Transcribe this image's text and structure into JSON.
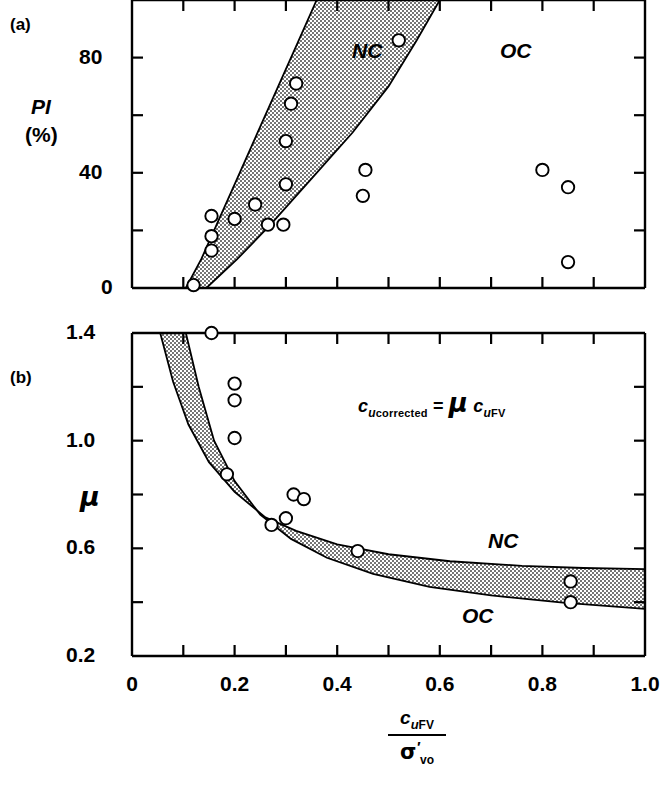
{
  "figure": {
    "panel_a_tag": "(a)",
    "panel_b_tag": "(b)",
    "equation": {
      "c1": "c",
      "sub1_i": "u",
      "sub1": "corrected",
      "equals": "=",
      "mu": "μ",
      "c2": "c",
      "sub2_i": "u",
      "sub2": "FV"
    },
    "xaxis_title": {
      "numer_c": "c",
      "numer_sub_i": "u",
      "numer_sub": "FV",
      "denom_sigma": "σ",
      "denom_prime": "′",
      "denom_sub": "vo"
    }
  },
  "chart_data": [
    {
      "type": "scatter",
      "panel": "(a)",
      "title": "",
      "xlabel": "c_u FV / sigma'_vo",
      "ylabel": "PI (%)",
      "ylabel_lines": [
        "PI",
        "(%)"
      ],
      "xlim": [
        0,
        1.0
      ],
      "ylim": [
        0,
        100
      ],
      "xticks": [
        0,
        0.1,
        0.2,
        0.3,
        0.4,
        0.5,
        0.6,
        0.7,
        0.8,
        0.9,
        1.0
      ],
      "yticks": [
        0,
        20,
        40,
        60,
        80,
        100
      ],
      "ytick_labels": [
        {
          "value": 0,
          "label": "0"
        },
        {
          "value": 40,
          "label": "40"
        },
        {
          "value": 80,
          "label": "80"
        }
      ],
      "grid": false,
      "annotations": [
        {
          "text": "NC",
          "x": 0.45,
          "y": 82
        },
        {
          "text": "OC",
          "x": 0.73,
          "y": 82
        }
      ],
      "bands": [
        {
          "name": "NC-OC transition band",
          "shaded": true,
          "left_boundary": [
            [
              0.105,
              0
            ],
            [
              0.135,
              10
            ],
            [
              0.165,
              22
            ],
            [
              0.205,
              38
            ],
            [
              0.245,
              54
            ],
            [
              0.285,
              70
            ],
            [
              0.325,
              86
            ],
            [
              0.36,
              100
            ]
          ],
          "right_boundary": [
            [
              0.145,
              0
            ],
            [
              0.205,
              10
            ],
            [
              0.27,
              22
            ],
            [
              0.35,
              38
            ],
            [
              0.43,
              54
            ],
            [
              0.5,
              70
            ],
            [
              0.555,
              86
            ],
            [
              0.6,
              100
            ]
          ]
        }
      ],
      "points": [
        {
          "x": 0.12,
          "y": 1
        },
        {
          "x": 0.155,
          "y": 25
        },
        {
          "x": 0.155,
          "y": 18
        },
        {
          "x": 0.155,
          "y": 13
        },
        {
          "x": 0.2,
          "y": 24
        },
        {
          "x": 0.24,
          "y": 29
        },
        {
          "x": 0.265,
          "y": 22
        },
        {
          "x": 0.295,
          "y": 22
        },
        {
          "x": 0.3,
          "y": 36
        },
        {
          "x": 0.3,
          "y": 51
        },
        {
          "x": 0.31,
          "y": 64
        },
        {
          "x": 0.32,
          "y": 71
        },
        {
          "x": 0.455,
          "y": 41
        },
        {
          "x": 0.45,
          "y": 32
        },
        {
          "x": 0.52,
          "y": 86
        },
        {
          "x": 0.8,
          "y": 41
        },
        {
          "x": 0.85,
          "y": 35
        },
        {
          "x": 0.85,
          "y": 9
        }
      ]
    },
    {
      "type": "scatter",
      "panel": "(b)",
      "title": "",
      "xlabel": "c_u FV / sigma'_vo",
      "ylabel": "μ",
      "xlim": [
        0,
        1.0
      ],
      "ylim": [
        0.2,
        1.4
      ],
      "xticks": [
        0,
        0.1,
        0.2,
        0.3,
        0.4,
        0.5,
        0.6,
        0.7,
        0.8,
        0.9,
        1.0
      ],
      "xtick_labels": [
        {
          "value": 0,
          "label": "0"
        },
        {
          "value": 0.2,
          "label": "0.2"
        },
        {
          "value": 0.4,
          "label": "0.4"
        },
        {
          "value": 0.6,
          "label": "0.6"
        },
        {
          "value": 0.8,
          "label": "0.8"
        },
        {
          "value": 1.0,
          "label": "1.0"
        }
      ],
      "yticks": [
        0.2,
        0.4,
        0.6,
        0.8,
        1.0,
        1.2,
        1.4
      ],
      "ytick_labels": [
        {
          "value": 0.2,
          "label": "0.2"
        },
        {
          "value": 0.6,
          "label": "0.6"
        },
        {
          "value": 1.0,
          "label": "1.0"
        },
        {
          "value": 1.4,
          "label": "1.4"
        }
      ],
      "grid": false,
      "annotations": [
        {
          "text": "NC",
          "x": 0.72,
          "y": 0.625
        },
        {
          "text": "OC",
          "x": 0.68,
          "y": 0.385
        }
      ],
      "bands": [
        {
          "name": "NC-OC correction band",
          "shaded": true,
          "upper_boundary_NC": [
            [
              0.055,
              1.4
            ],
            [
              0.08,
              1.22
            ],
            [
              0.11,
              1.06
            ],
            [
              0.15,
              0.92
            ],
            [
              0.2,
              0.81
            ],
            [
              0.26,
              0.715
            ],
            [
              0.32,
              0.665
            ],
            [
              0.4,
              0.615
            ],
            [
              0.5,
              0.578
            ],
            [
              0.62,
              0.552
            ],
            [
              0.76,
              0.535
            ],
            [
              0.88,
              0.527
            ],
            [
              1.0,
              0.523
            ]
          ],
          "lower_boundary_OC": [
            [
              0.105,
              1.4
            ],
            [
              0.13,
              1.2
            ],
            [
              0.16,
              1.0
            ],
            [
              0.2,
              0.85
            ],
            [
              0.25,
              0.725
            ],
            [
              0.31,
              0.635
            ],
            [
              0.38,
              0.565
            ],
            [
              0.47,
              0.505
            ],
            [
              0.58,
              0.457
            ],
            [
              0.7,
              0.425
            ],
            [
              0.84,
              0.398
            ],
            [
              1.0,
              0.375
            ]
          ]
        }
      ],
      "points": [
        {
          "x": 0.155,
          "y": 1.4
        },
        {
          "x": 0.2,
          "y": 1.212
        },
        {
          "x": 0.2,
          "y": 1.15
        },
        {
          "x": 0.2,
          "y": 1.01
        },
        {
          "x": 0.185,
          "y": 0.875
        },
        {
          "x": 0.315,
          "y": 0.8
        },
        {
          "x": 0.335,
          "y": 0.783
        },
        {
          "x": 0.3,
          "y": 0.712
        },
        {
          "x": 0.272,
          "y": 0.687
        },
        {
          "x": 0.44,
          "y": 0.59
        },
        {
          "x": 0.855,
          "y": 0.477
        },
        {
          "x": 0.855,
          "y": 0.4
        }
      ]
    }
  ]
}
